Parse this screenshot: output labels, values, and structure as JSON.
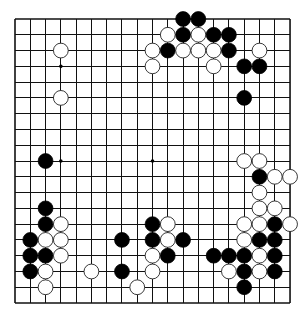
{
  "board": {
    "size": 19,
    "origin": {
      "x": 15,
      "y": 19
    },
    "spacing": {
      "x": 15.28,
      "y": 15.78
    },
    "stone_radius": 7.4,
    "colors": {
      "line": "#111111",
      "black": "#000000",
      "white": "#ffffff",
      "background": "#ffffff"
    },
    "star_points": [
      [
        3,
        3
      ],
      [
        3,
        9
      ],
      [
        9,
        9
      ]
    ],
    "black_stones": [
      [
        11,
        0
      ],
      [
        12,
        0
      ],
      [
        11,
        1
      ],
      [
        13,
        1
      ],
      [
        14,
        1
      ],
      [
        10,
        2
      ],
      [
        14,
        2
      ],
      [
        15,
        3
      ],
      [
        16,
        3
      ],
      [
        15,
        5
      ],
      [
        2,
        9
      ],
      [
        16,
        10
      ],
      [
        2,
        12
      ],
      [
        2,
        13
      ],
      [
        9,
        13
      ],
      [
        17,
        13
      ],
      [
        1,
        14
      ],
      [
        7,
        14
      ],
      [
        9,
        14
      ],
      [
        11,
        14
      ],
      [
        16,
        14
      ],
      [
        17,
        14
      ],
      [
        1,
        15
      ],
      [
        2,
        15
      ],
      [
        10,
        15
      ],
      [
        13,
        15
      ],
      [
        14,
        15
      ],
      [
        15,
        15
      ],
      [
        17,
        15
      ],
      [
        1,
        16
      ],
      [
        7,
        16
      ],
      [
        15,
        16
      ],
      [
        17,
        16
      ],
      [
        15,
        17
      ]
    ],
    "white_stones": [
      [
        10,
        1
      ],
      [
        12,
        1
      ],
      [
        3,
        2
      ],
      [
        9,
        2
      ],
      [
        11,
        2
      ],
      [
        12,
        2
      ],
      [
        13,
        2
      ],
      [
        16,
        2
      ],
      [
        9,
        3
      ],
      [
        13,
        3
      ],
      [
        3,
        5
      ],
      [
        15,
        9
      ],
      [
        16,
        9
      ],
      [
        17,
        10
      ],
      [
        18,
        10
      ],
      [
        16,
        11
      ],
      [
        16,
        12
      ],
      [
        17,
        12
      ],
      [
        3,
        13
      ],
      [
        10,
        13
      ],
      [
        15,
        13
      ],
      [
        16,
        13
      ],
      [
        18,
        13
      ],
      [
        2,
        14
      ],
      [
        3,
        14
      ],
      [
        10,
        14
      ],
      [
        15,
        14
      ],
      [
        3,
        15
      ],
      [
        9,
        15
      ],
      [
        16,
        15
      ],
      [
        2,
        16
      ],
      [
        5,
        16
      ],
      [
        9,
        16
      ],
      [
        14,
        16
      ],
      [
        16,
        16
      ],
      [
        2,
        17
      ],
      [
        8,
        17
      ]
    ]
  }
}
